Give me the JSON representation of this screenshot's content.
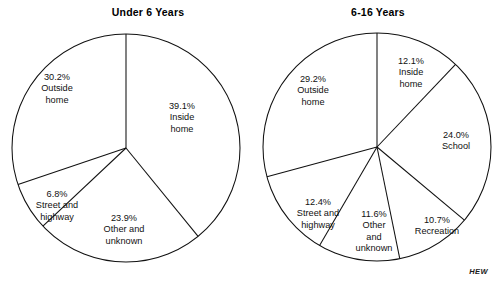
{
  "figure": {
    "source_credit": "HEW",
    "background_color": "#ffffff",
    "stroke_color": "#111111"
  },
  "chart_data": [
    {
      "type": "pie",
      "id": "under-6-years",
      "title": "Under 6 Years",
      "xlabel": "",
      "ylabel": "",
      "legend": "none",
      "grid": false,
      "start_angle_deg": 0,
      "direction": "clockwise",
      "categories": [
        "Inside home",
        "Other and unknown",
        "Street and highway",
        "Outside home"
      ],
      "values": [
        39.1,
        23.9,
        6.8,
        30.2
      ],
      "slices": [
        {
          "label": "Inside home",
          "percent": 39.1,
          "pct_text": "39.1%",
          "name_text": "Inside\nhome",
          "label_x": 182,
          "label_y": 118
        },
        {
          "label": "Other and unknown",
          "percent": 23.9,
          "pct_text": "23.9%",
          "name_text": "Other and\nunknown",
          "label_x": 124,
          "label_y": 230
        },
        {
          "label": "Street and highway",
          "percent": 6.8,
          "pct_text": "6.8%",
          "name_text": "Street and\nhighway",
          "label_x": 57,
          "label_y": 206
        },
        {
          "label": "Outside home",
          "percent": 30.2,
          "pct_text": "30.2%",
          "name_text": "Outside\nhome",
          "label_x": 57,
          "label_y": 89
        }
      ]
    },
    {
      "type": "pie",
      "id": "6-16-years",
      "title": "6-16 Years",
      "xlabel": "",
      "ylabel": "",
      "legend": "none",
      "grid": false,
      "start_angle_deg": 0,
      "direction": "clockwise",
      "categories": [
        "Inside home",
        "School",
        "Recreation",
        "Other and unknown",
        "Street and highway",
        "Outside home"
      ],
      "values": [
        12.1,
        24.0,
        10.7,
        11.6,
        12.4,
        29.2
      ],
      "slices": [
        {
          "label": "Inside home",
          "percent": 12.1,
          "pct_text": "12.1%",
          "name_text": "Inside\nhome",
          "label_x": 411,
          "label_y": 73
        },
        {
          "label": "School",
          "percent": 24.0,
          "pct_text": "24.0%",
          "name_text": "School",
          "label_x": 456,
          "label_y": 141
        },
        {
          "label": "Recreation",
          "percent": 10.7,
          "pct_text": "10.7%",
          "name_text": "Recreation",
          "label_x": 437,
          "label_y": 226
        },
        {
          "label": "Other and unknown",
          "percent": 11.6,
          "pct_text": "11.6%",
          "name_text": "Other\nand\nunknown",
          "label_x": 374,
          "label_y": 232
        },
        {
          "label": "Street and highway",
          "percent": 12.4,
          "pct_text": "12.4%",
          "name_text": "Street and\nhighway",
          "label_x": 318,
          "label_y": 214
        },
        {
          "label": "Outside home",
          "percent": 29.2,
          "pct_text": "29.2%",
          "name_text": "Outside\nhome",
          "label_x": 313,
          "label_y": 91
        }
      ]
    }
  ]
}
